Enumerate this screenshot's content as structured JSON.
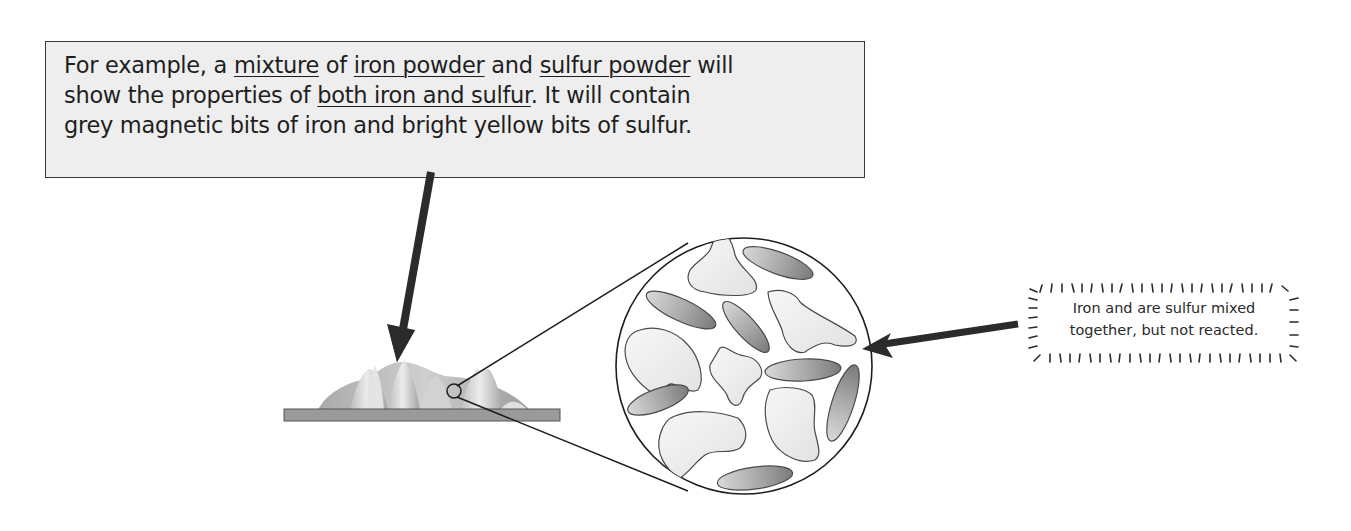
{
  "caption": {
    "line1": {
      "t1": "For example, a ",
      "u1": "mixture",
      "t2": " of ",
      "u2": "iron powder",
      "t3": " and ",
      "u3": "sulfur powder",
      "t4": " will"
    },
    "line2": {
      "t1": "show the properties of ",
      "u1": "both iron and sulfur",
      "t2": ".  It will contain"
    },
    "line3": {
      "t1": "grey magnetic bits of iron and bright yellow bits of sulfur."
    }
  },
  "note": {
    "line1": "Iron and are sulfur mixed",
    "line2": "together, but not reacted."
  },
  "colors": {
    "caption_bg": "#eeeeee",
    "arrow": "#2b2b2b",
    "plate": "#9a9a9a",
    "iron_particle": "#8a8a8a",
    "sulfur_particle": "#ebebeb"
  },
  "icons": {
    "pointer_arrow_down": "arrow-down-icon",
    "pointer_arrow_left": "arrow-left-icon",
    "magnifier_circle": "magnifier-circle-icon"
  }
}
